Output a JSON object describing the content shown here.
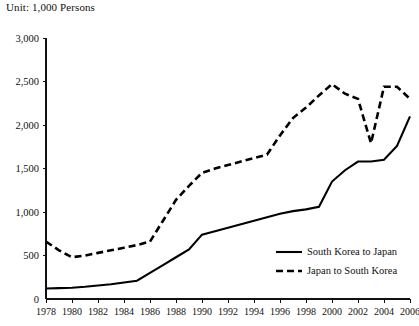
{
  "unit_note": "Unit: 1,000 Persons",
  "legend": {
    "entries": [
      {
        "label": "South Korea to Japan",
        "style": "solid"
      },
      {
        "label": "Japan to South Korea",
        "style": "dashed"
      }
    ]
  },
  "chart_data": {
    "type": "line",
    "title": "",
    "subtitle": "",
    "xlabel": "",
    "ylabel": "",
    "unit": "1,000 Persons",
    "grid": false,
    "legend_position": "inside-bottom-right",
    "xlim": [
      1978,
      2006
    ],
    "ylim": [
      0,
      3000
    ],
    "ytick_values": [
      0,
      500,
      1000,
      1500,
      2000,
      2500,
      3000
    ],
    "ytick_labels": [
      "0",
      "500",
      "1,000",
      "1,500",
      "2,000",
      "2,500",
      "3,000"
    ],
    "xtick_values": [
      1978,
      1980,
      1982,
      1984,
      1986,
      1988,
      1990,
      1992,
      1994,
      1996,
      1998,
      2000,
      2002,
      2004,
      2006
    ],
    "xtick_labels": [
      "1978",
      "1980",
      "1982",
      "1984",
      "1986",
      "1988",
      "1990",
      "1992",
      "1994",
      "1996",
      "1998",
      "2000",
      "2002",
      "2004",
      "2006"
    ],
    "x": [
      1978,
      1979,
      1980,
      1981,
      1982,
      1983,
      1984,
      1985,
      1986,
      1987,
      1988,
      1989,
      1990,
      1991,
      1992,
      1993,
      1994,
      1995,
      1996,
      1997,
      1998,
      1999,
      2000,
      2001,
      2002,
      2003,
      2004,
      2005,
      2006
    ],
    "series": [
      {
        "name": "South Korea to Japan",
        "style": "solid",
        "color": "#000000",
        "values": [
          120,
          125,
          130,
          140,
          155,
          170,
          190,
          210,
          300,
          390,
          480,
          570,
          740,
          780,
          820,
          860,
          900,
          940,
          980,
          1010,
          1030,
          1060,
          1350,
          1480,
          1580,
          1580,
          1600,
          1760,
          2100
        ]
      },
      {
        "name": "Japan to South Korea",
        "style": "dashed",
        "color": "#000000",
        "values": [
          660,
          560,
          480,
          500,
          530,
          560,
          590,
          620,
          660,
          900,
          1140,
          1300,
          1450,
          1500,
          1540,
          1580,
          1620,
          1660,
          1880,
          2080,
          2200,
          2340,
          2470,
          2360,
          2300,
          1790,
          2440,
          2440,
          2300
        ]
      }
    ]
  }
}
